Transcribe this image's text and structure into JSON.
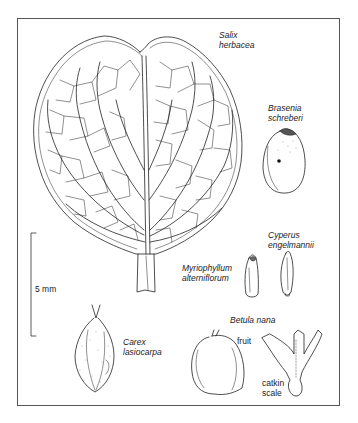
{
  "figure": {
    "type": "botanical-illustration",
    "frame_color": "#555555",
    "ink_color": "#222222"
  },
  "labels": {
    "salix": "Salix\nherbacea",
    "brasenia": "Brasenia\nschreberi",
    "cyperus": "Cyperus\nengelmannii",
    "myriophyllum": "Myriophyllum\nalterniflorum",
    "carex": "Carex\nlasiocarpa",
    "betula": "Betula nana",
    "fruit": "fruit",
    "catkin_scale": "catkin\nscale"
  },
  "scale_bar": {
    "label": "5 mm"
  },
  "specimens": [
    {
      "name": "Salix herbacea",
      "part": "leaf"
    },
    {
      "name": "Brasenia schreberi",
      "part": "seed"
    },
    {
      "name": "Cyperus engelmannii",
      "part": "achene"
    },
    {
      "name": "Myriophyllum alterniflorum",
      "part": "fruitlet"
    },
    {
      "name": "Carex lasiocarpa",
      "part": "utricle"
    },
    {
      "name": "Betula nana",
      "part": "fruit and catkin scale"
    }
  ]
}
